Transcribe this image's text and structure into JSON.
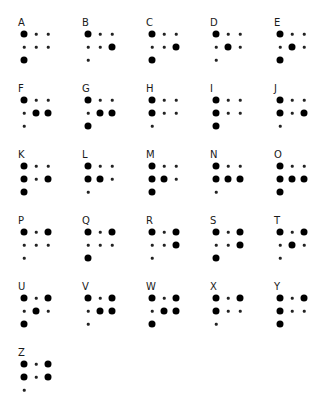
{
  "colors": {
    "background": "#ffffff",
    "dot": "#000000",
    "label": "#1a1a1a"
  },
  "layout": {
    "columns": 5,
    "origin_x": 18,
    "origin_y": 18,
    "col_step": 64,
    "row_step": 66,
    "dot_offset_x": [
      6,
      18,
      30
    ],
    "dot_offset_y": [
      16,
      29,
      42
    ]
  },
  "letters": [
    {
      "letter": "A",
      "row1": [
        1,
        0,
        0
      ],
      "row2": [
        0,
        0,
        0
      ],
      "row3": [
        1
      ]
    },
    {
      "letter": "B",
      "row1": [
        1,
        0,
        0
      ],
      "row2": [
        0,
        0,
        1
      ],
      "row3": [
        0
      ]
    },
    {
      "letter": "C",
      "row1": [
        1,
        0,
        0
      ],
      "row2": [
        0,
        0,
        1
      ],
      "row3": [
        1
      ]
    },
    {
      "letter": "D",
      "row1": [
        1,
        0,
        0
      ],
      "row2": [
        0,
        1,
        0
      ],
      "row3": [
        0
      ]
    },
    {
      "letter": "E",
      "row1": [
        1,
        0,
        0
      ],
      "row2": [
        0,
        1,
        0
      ],
      "row3": [
        1
      ]
    },
    {
      "letter": "F",
      "row1": [
        1,
        0,
        0
      ],
      "row2": [
        0,
        1,
        1
      ],
      "row3": [
        0
      ]
    },
    {
      "letter": "G",
      "row1": [
        1,
        0,
        0
      ],
      "row2": [
        0,
        1,
        1
      ],
      "row3": [
        1
      ]
    },
    {
      "letter": "H",
      "row1": [
        1,
        0,
        0
      ],
      "row2": [
        1,
        0,
        0
      ],
      "row3": [
        0
      ]
    },
    {
      "letter": "I",
      "row1": [
        1,
        0,
        0
      ],
      "row2": [
        1,
        0,
        0
      ],
      "row3": [
        1
      ]
    },
    {
      "letter": "J",
      "row1": [
        1,
        0,
        0
      ],
      "row2": [
        1,
        0,
        1
      ],
      "row3": [
        0
      ]
    },
    {
      "letter": "K",
      "row1": [
        1,
        0,
        0
      ],
      "row2": [
        1,
        0,
        1
      ],
      "row3": [
        1
      ]
    },
    {
      "letter": "L",
      "row1": [
        1,
        0,
        0
      ],
      "row2": [
        1,
        1,
        0
      ],
      "row3": [
        0
      ]
    },
    {
      "letter": "M",
      "row1": [
        1,
        0,
        0
      ],
      "row2": [
        1,
        1,
        0
      ],
      "row3": [
        1
      ]
    },
    {
      "letter": "N",
      "row1": [
        1,
        0,
        0
      ],
      "row2": [
        1,
        1,
        1
      ],
      "row3": [
        0
      ]
    },
    {
      "letter": "O",
      "row1": [
        1,
        0,
        0
      ],
      "row2": [
        1,
        1,
        1
      ],
      "row3": [
        1
      ]
    },
    {
      "letter": "P",
      "row1": [
        1,
        0,
        1
      ],
      "row2": [
        0,
        0,
        0
      ],
      "row3": [
        0
      ]
    },
    {
      "letter": "Q",
      "row1": [
        1,
        0,
        1
      ],
      "row2": [
        0,
        0,
        0
      ],
      "row3": [
        1
      ]
    },
    {
      "letter": "R",
      "row1": [
        1,
        0,
        1
      ],
      "row2": [
        0,
        0,
        1
      ],
      "row3": [
        0
      ]
    },
    {
      "letter": "S",
      "row1": [
        1,
        0,
        1
      ],
      "row2": [
        0,
        0,
        1
      ],
      "row3": [
        1
      ]
    },
    {
      "letter": "T",
      "row1": [
        1,
        0,
        1
      ],
      "row2": [
        0,
        1,
        0
      ],
      "row3": [
        0
      ]
    },
    {
      "letter": "U",
      "row1": [
        1,
        0,
        1
      ],
      "row2": [
        0,
        1,
        0
      ],
      "row3": [
        1
      ]
    },
    {
      "letter": "V",
      "row1": [
        1,
        0,
        1
      ],
      "row2": [
        0,
        1,
        1
      ],
      "row3": [
        0
      ]
    },
    {
      "letter": "W",
      "row1": [
        1,
        0,
        1
      ],
      "row2": [
        0,
        1,
        1
      ],
      "row3": [
        1
      ]
    },
    {
      "letter": "X",
      "row1": [
        1,
        0,
        1
      ],
      "row2": [
        1,
        0,
        0
      ],
      "row3": [
        0
      ]
    },
    {
      "letter": "Y",
      "row1": [
        1,
        0,
        1
      ],
      "row2": [
        1,
        0,
        0
      ],
      "row3": [
        1
      ]
    },
    {
      "letter": "Z",
      "row1": [
        1,
        0,
        1
      ],
      "row2": [
        1,
        0,
        1
      ],
      "row3": [
        0
      ]
    }
  ]
}
